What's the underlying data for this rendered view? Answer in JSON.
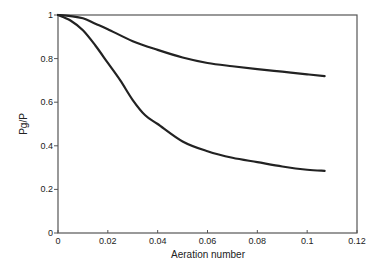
{
  "chart_data": {
    "type": "line",
    "title": "",
    "xlabel": "Aeration number",
    "ylabel": "Pg/P",
    "xlim": [
      0,
      0.12
    ],
    "ylim": [
      0,
      1
    ],
    "xticks": [
      0,
      0.02,
      0.04,
      0.06,
      0.08,
      0.1,
      0.12
    ],
    "xtick_labels": [
      "0",
      "0.02",
      "0.04",
      "0.06",
      "0.08",
      "0.1",
      "0.12"
    ],
    "yticks": [
      0,
      0.2,
      0.4,
      0.6,
      0.8,
      1
    ],
    "ytick_labels": [
      "0",
      "0.2",
      "0.4",
      "0.6",
      "0.8",
      "1"
    ],
    "grid": false,
    "legend": null,
    "line_color": "#222222",
    "series": [
      {
        "name": "upper curve",
        "x": [
          0,
          0.005,
          0.01,
          0.015,
          0.02,
          0.03,
          0.04,
          0.05,
          0.06,
          0.07,
          0.08,
          0.09,
          0.1,
          0.107
        ],
        "y": [
          1.0,
          0.995,
          0.985,
          0.96,
          0.935,
          0.88,
          0.84,
          0.805,
          0.78,
          0.765,
          0.752,
          0.74,
          0.728,
          0.72
        ]
      },
      {
        "name": "lower curve",
        "x": [
          0,
          0.005,
          0.01,
          0.015,
          0.02,
          0.025,
          0.03,
          0.035,
          0.04,
          0.05,
          0.06,
          0.07,
          0.08,
          0.09,
          0.1,
          0.107
        ],
        "y": [
          1.0,
          0.975,
          0.93,
          0.86,
          0.78,
          0.7,
          0.61,
          0.54,
          0.5,
          0.42,
          0.375,
          0.345,
          0.325,
          0.305,
          0.29,
          0.285
        ]
      }
    ]
  }
}
